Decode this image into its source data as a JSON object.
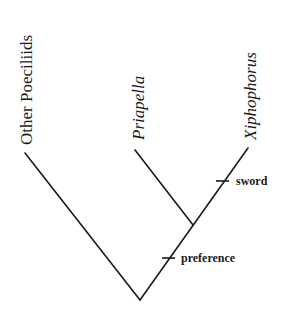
{
  "diagram": {
    "type": "cladogram",
    "taxa": [
      {
        "label": "Other Poeciliids",
        "italic": false
      },
      {
        "label": "Priapella",
        "italic": true
      },
      {
        "label": "Xiphophorus",
        "italic": true
      }
    ],
    "characters": [
      {
        "label": "sword",
        "branch": "Xiphophorus"
      },
      {
        "label": "preference",
        "branch": "Priapella+Xiphophorus"
      }
    ],
    "colors": {
      "line": "#1a1a1a",
      "background": "#ffffff"
    }
  }
}
